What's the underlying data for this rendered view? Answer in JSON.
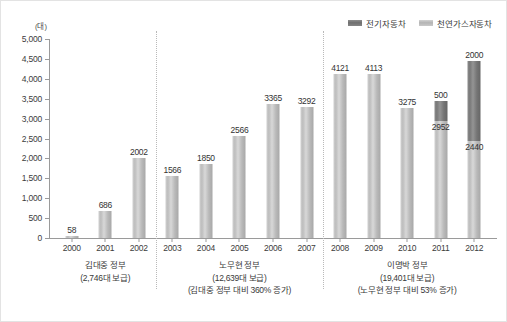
{
  "legend": {
    "items": [
      {
        "label": "전기자동차",
        "key": "ev",
        "color": "#7a7a7a"
      },
      {
        "label": "천연가스자동차",
        "key": "cng",
        "color": "#c4c4c4"
      }
    ]
  },
  "axis": {
    "unit": "(대)",
    "y_ticks": [
      "5,000",
      "4,500",
      "4,000",
      "3,500",
      "3,000",
      "2,500",
      "2,000",
      "1,500",
      "1,000",
      "500",
      "0"
    ]
  },
  "eras": [
    {
      "name": "김대중 정부",
      "total": "(2,746대 보급)",
      "note": ""
    },
    {
      "name": "노무현 정부",
      "total": "(12,639대 보급)",
      "note": "(김대중 정부 대비 360% 증가)"
    },
    {
      "name": "이명박 정부",
      "total": "(19,401대 보급)",
      "note": "(노무현 정부 대비 53% 증가)"
    }
  ],
  "chart_data": {
    "type": "bar",
    "title": "",
    "xlabel": "",
    "ylabel": "(대)",
    "ylim": [
      0,
      5000
    ],
    "ytick_step": 500,
    "grid": false,
    "legend_position": "top-right",
    "stacked": true,
    "categories": [
      "2000",
      "2001",
      "2002",
      "2003",
      "2004",
      "2005",
      "2006",
      "2007",
      "2008",
      "2009",
      "2010",
      "2011",
      "2012"
    ],
    "series": [
      {
        "name": "천연가스자동차",
        "color": "#c4c4c4",
        "values": [
          58,
          686,
          2002,
          1566,
          1850,
          2566,
          3365,
          3292,
          4121,
          4113,
          3275,
          2952,
          2440
        ]
      },
      {
        "name": "전기자동차",
        "color": "#7a7a7a",
        "values": [
          0,
          0,
          0,
          0,
          0,
          0,
          0,
          0,
          0,
          0,
          0,
          500,
          2000
        ]
      }
    ],
    "labels": {
      "2000": [
        "58"
      ],
      "2001": [
        "686"
      ],
      "2002": [
        "2002"
      ],
      "2003": [
        "1566"
      ],
      "2004": [
        "1850"
      ],
      "2005": [
        "2566"
      ],
      "2006": [
        "3365"
      ],
      "2007": [
        "3292"
      ],
      "2008": [
        "4121"
      ],
      "2009": [
        "4113"
      ],
      "2010": [
        "3275"
      ],
      "2011": [
        "2952",
        "500"
      ],
      "2012": [
        "2440",
        "2000"
      ]
    },
    "groups": [
      {
        "label": "김대중 정부",
        "categories": [
          "2000",
          "2001",
          "2002"
        ]
      },
      {
        "label": "노무현 정부",
        "categories": [
          "2003",
          "2004",
          "2005",
          "2006",
          "2007"
        ]
      },
      {
        "label": "이명박 정부",
        "categories": [
          "2008",
          "2009",
          "2010",
          "2011",
          "2012"
        ]
      }
    ]
  }
}
